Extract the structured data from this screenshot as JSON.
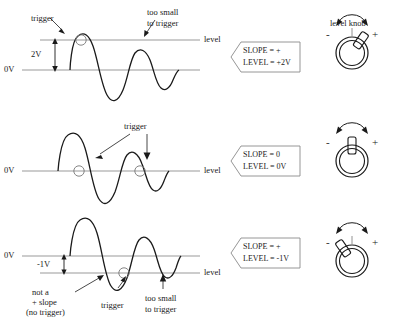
{
  "figure": {
    "title_right": "level knob",
    "baseline_label": "0V",
    "level_label": "level"
  },
  "panels": [
    {
      "id": "panel-top",
      "baseline_label": "0V",
      "level_label": "level",
      "level_offset_label": "2V",
      "annotations": [
        {
          "name": "trigger-label",
          "text": "trigger"
        },
        {
          "name": "too-small-label-line1",
          "text": "too small"
        },
        {
          "name": "too-small-label-line2",
          "text": "to trigger"
        }
      ],
      "callout": {
        "line1": "SLOPE = +",
        "line2": "LEVEL = +2V"
      },
      "knob": {
        "minus": "-",
        "plus": "+",
        "pointer_angle_deg": 35
      }
    },
    {
      "id": "panel-middle",
      "baseline_label": "0V",
      "level_label": "level",
      "level_offset_label": "",
      "annotations": [
        {
          "name": "trigger-label",
          "text": "trigger"
        }
      ],
      "callout": {
        "line1": "SLOPE = 0",
        "line2": "LEVEL = 0V"
      },
      "knob": {
        "minus": "-",
        "plus": "+",
        "pointer_angle_deg": 0
      }
    },
    {
      "id": "panel-bottom",
      "baseline_label": "0V",
      "level_label": "level",
      "level_offset_label": "-1V",
      "annotations": [
        {
          "name": "not-a-plus-slope-line1",
          "text": "not a"
        },
        {
          "name": "not-a-plus-slope-line2",
          "text": "+ slope"
        },
        {
          "name": "not-a-plus-slope-line3",
          "text": "(no trigger)"
        },
        {
          "name": "trigger-label",
          "text": "trigger"
        },
        {
          "name": "too-small-label-line1",
          "text": "too small"
        },
        {
          "name": "too-small-label-line2",
          "text": "to trigger"
        }
      ],
      "callout": {
        "line1": "SLOPE = +",
        "line2": "LEVEL = -1V"
      },
      "knob": {
        "minus": "-",
        "plus": "+",
        "pointer_angle_deg": -35
      }
    }
  ],
  "colors": {
    "waveform": "#1a1a1a",
    "reference_line": "#999999",
    "text": "#1a1a1a",
    "callout_border": "#8a8a8a"
  }
}
